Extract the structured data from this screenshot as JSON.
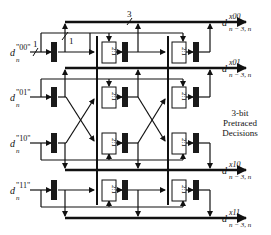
{
  "diagram": {
    "inputs": [
      {
        "base": "d",
        "sup": "\"00\"",
        "sub": "n"
      },
      {
        "base": "d",
        "sup": "\"01\"",
        "sub": "n"
      },
      {
        "base": "d",
        "sup": "\"10\"",
        "sub": "n"
      },
      {
        "base": "d",
        "sup": "\"11\"",
        "sub": "n"
      }
    ],
    "outputs": [
      {
        "base": "d",
        "sup": "x00",
        "sub": "n − 3, n"
      },
      {
        "base": "d",
        "sup": "x01",
        "sub": "n − 3, n"
      },
      {
        "base": "d",
        "sup": "x10",
        "sub": "n − 3, n"
      },
      {
        "base": "d",
        "sup": "x11",
        "sub": "n − 3, n"
      }
    ],
    "mux_label": "2:1",
    "bus_width_labels": {
      "input": "1",
      "tap": "1",
      "output": "3"
    },
    "side_note": [
      "3-bit",
      "Pretraced",
      "Decisions"
    ],
    "colors": {
      "line": "#111111",
      "register": "#1a1a1a",
      "background": "#ffffff"
    }
  }
}
